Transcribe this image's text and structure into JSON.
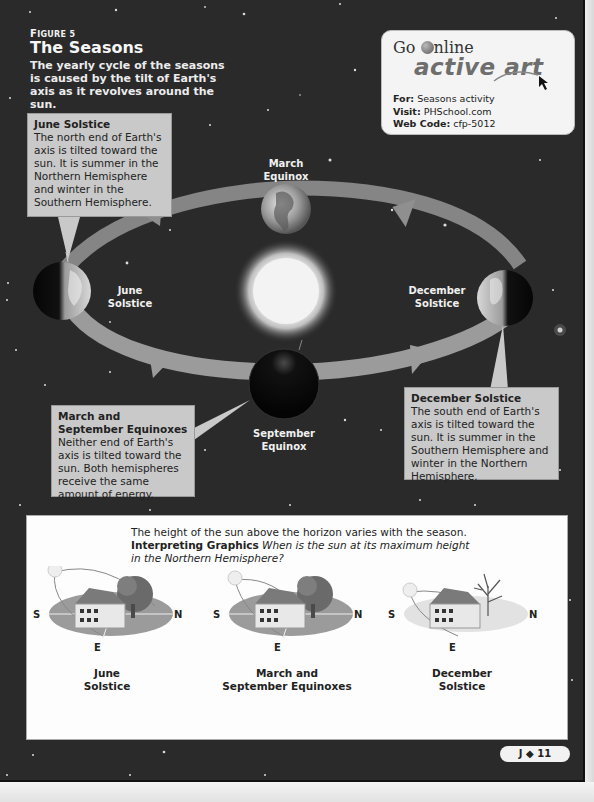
{
  "figure": {
    "label_prefix": "F",
    "label_rest": "IGURE 5",
    "title": "The Seasons",
    "caption": "The yearly cycle of the seasons is caused by the tilt of Earth's axis as it revolves around the sun."
  },
  "go_online": {
    "go_text": "Go ",
    "online_text": "nline",
    "logo_text": "active art",
    "for_label": "For:",
    "for_value": "Seasons activity",
    "visit_label": "Visit:",
    "visit_value": "PHSchool.com",
    "code_label": "Web Code:",
    "code_value": "cfp-5012"
  },
  "orbit_labels": {
    "march": [
      "March",
      "Equinox"
    ],
    "june": [
      "June",
      "Solstice"
    ],
    "december": [
      "December",
      "Solstice"
    ],
    "september": [
      "September",
      "Equinox"
    ]
  },
  "callouts": {
    "june": {
      "title": "June Solstice",
      "body": "The north end of Earth's axis is tilted toward the sun. It is summer in the Northern Hemisphere and winter in the Southern Hemisphere."
    },
    "equinox": {
      "title": "March and September Equinoxes",
      "body": "Neither end of Earth's axis is tilted toward the sun. Both hemispheres receive the same amount of energy."
    },
    "december": {
      "title": "December Solstice",
      "body": "The south end of Earth's axis is tilted toward the sun. It is summer in the Southern Hemisphere and winter in the Northern Hemisphere."
    }
  },
  "panel": {
    "intro": "The height of the sun above the horizon varies with the season.",
    "question_label": "Interpreting Graphics",
    "question": "When is the sun at its maximum height in the Northern Hemisphere?",
    "directions": {
      "south": "S",
      "north": "N",
      "east": "E"
    },
    "scenes": [
      {
        "label_line1": "June",
        "label_line2": "Solstice"
      },
      {
        "label_line1": "March and",
        "label_line2": "September Equinoxes"
      },
      {
        "label_line1": "December",
        "label_line2": "Solstice"
      }
    ]
  },
  "page_number": {
    "section": "J",
    "separator": "◆",
    "number": "11"
  }
}
